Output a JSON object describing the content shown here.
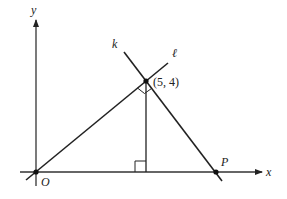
{
  "diagram": {
    "type": "coordinate-geometry",
    "axes": {
      "x_label": "x",
      "y_label": "y",
      "origin_label": "O"
    },
    "lines": [
      {
        "name": "k",
        "label": "k",
        "description": "line through (5,4) and P, perpendicular to ℓ"
      },
      {
        "name": "l",
        "label": "ℓ",
        "description": "line through O and (5,4)"
      }
    ],
    "points": [
      {
        "name": "O",
        "label": "O"
      },
      {
        "name": "intersection",
        "label": "(5, 4)"
      },
      {
        "name": "P",
        "label": "P"
      }
    ],
    "annotations": [
      "right angle between k and ℓ at (5,4)",
      "vertical segment from (5,4) to x-axis with right angle mark"
    ]
  }
}
